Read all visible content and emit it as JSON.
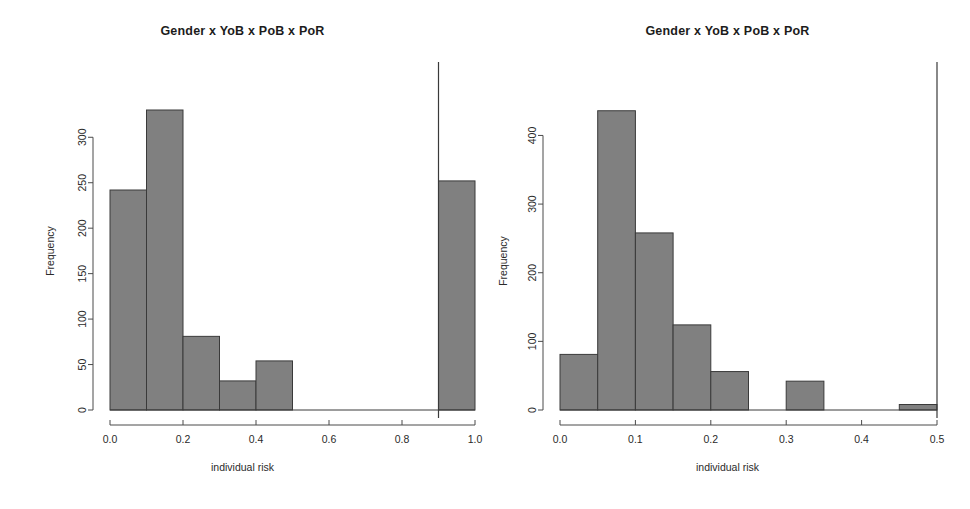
{
  "figure": {
    "background_color": "#ffffff",
    "bar_fill_color": "#808080",
    "bar_border_color": "#3a3a3a",
    "axis_color": "#4a4a4a",
    "panel_count": 2
  },
  "chart_data": [
    {
      "type": "bar",
      "id": "left-histogram",
      "title": "Gender x YoB x PoB x PoR",
      "xlabel": "individual risk",
      "ylabel": "Frequency",
      "xlim": [
        0.0,
        1.0
      ],
      "ylim": [
        0,
        330
      ],
      "grid": false,
      "legend": "none",
      "xticks": [
        "0.0",
        "0.2",
        "0.4",
        "0.6",
        "0.8",
        "1.0"
      ],
      "xtick_values": [
        0.0,
        0.2,
        0.4,
        0.6,
        0.8,
        1.0
      ],
      "yticks": [
        "0",
        "50",
        "100",
        "150",
        "200",
        "250",
        "300"
      ],
      "ytick_values": [
        0,
        50,
        100,
        150,
        200,
        250,
        300
      ],
      "bin_width": 0.1,
      "bin_edges": [
        0.0,
        0.1,
        0.2,
        0.3,
        0.4,
        0.5,
        0.6,
        0.7,
        0.8,
        0.9,
        1.0
      ],
      "categories": [
        "0.0-0.1",
        "0.1-0.2",
        "0.2-0.3",
        "0.3-0.4",
        "0.4-0.5",
        "0.5-0.6",
        "0.6-0.7",
        "0.7-0.8",
        "0.8-0.9",
        "0.9-1.0"
      ],
      "values": [
        242,
        330,
        81,
        32,
        54,
        0,
        0,
        0,
        0,
        252
      ],
      "annotations": [
        {
          "type": "vertical-line",
          "x": 0.9,
          "label": "threshold-line"
        }
      ]
    },
    {
      "type": "bar",
      "id": "right-histogram",
      "title": "Gender x YoB x PoB x PoR",
      "xlabel": "individual risk",
      "ylabel": "Frequency",
      "xlim": [
        0.0,
        0.5
      ],
      "ylim": [
        0,
        440
      ],
      "grid": false,
      "legend": "none",
      "xticks": [
        "0.0",
        "0.1",
        "0.2",
        "0.3",
        "0.4",
        "0.5"
      ],
      "xtick_values": [
        0.0,
        0.1,
        0.2,
        0.3,
        0.4,
        0.5
      ],
      "yticks": [
        "0",
        "100",
        "200",
        "300",
        "400"
      ],
      "ytick_values": [
        0,
        100,
        200,
        300,
        400
      ],
      "bin_width": 0.05,
      "bin_edges": [
        0.0,
        0.05,
        0.1,
        0.15,
        0.2,
        0.25,
        0.3,
        0.35,
        0.4,
        0.45,
        0.5
      ],
      "categories": [
        "0.00-0.05",
        "0.05-0.10",
        "0.10-0.15",
        "0.15-0.20",
        "0.20-0.25",
        "0.25-0.30",
        "0.30-0.35",
        "0.35-0.40",
        "0.40-0.45",
        "0.45-0.50"
      ],
      "values": [
        81,
        436,
        258,
        124,
        56,
        0,
        42,
        0,
        0,
        8
      ],
      "annotations": [
        {
          "type": "vertical-line",
          "x": 0.5,
          "label": "threshold-line"
        }
      ]
    }
  ]
}
